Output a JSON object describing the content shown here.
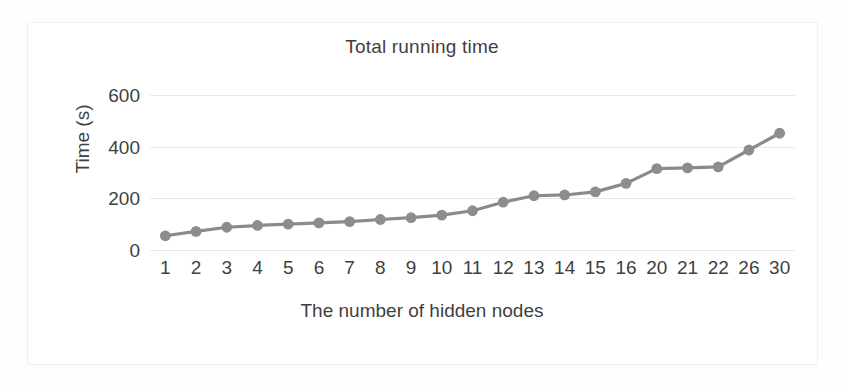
{
  "chart_data": {
    "type": "line",
    "title": "Total running time",
    "xlabel": "The number of hidden nodes",
    "ylabel": "Time (s)",
    "categories": [
      "1",
      "2",
      "3",
      "4",
      "5",
      "6",
      "7",
      "8",
      "9",
      "10",
      "11",
      "12",
      "13",
      "14",
      "15",
      "16",
      "20",
      "21",
      "22",
      "26",
      "30"
    ],
    "values": [
      55,
      72,
      88,
      95,
      100,
      105,
      110,
      118,
      125,
      135,
      152,
      185,
      210,
      213,
      225,
      258,
      315,
      318,
      322,
      387,
      452
    ],
    "ylim": [
      0,
      600
    ],
    "yticks": [
      0,
      200,
      400,
      600
    ],
    "ytick_labels": [
      "0",
      "200",
      "400",
      "600"
    ],
    "grid": true,
    "legend": "none",
    "series": [
      {
        "name": "Total running time",
        "values": [
          55,
          72,
          88,
          95,
          100,
          105,
          110,
          118,
          125,
          135,
          152,
          185,
          210,
          213,
          225,
          258,
          315,
          318,
          322,
          387,
          452
        ],
        "color": "#8a8a8a",
        "marker": "circle"
      }
    ],
    "colors": {
      "line": "#8a8a8a",
      "marker": "#8d8d8d",
      "gridline": "#e9e9e9",
      "text": "#3f3f3f",
      "frame": "#efefef",
      "background": "#ffffff"
    }
  }
}
